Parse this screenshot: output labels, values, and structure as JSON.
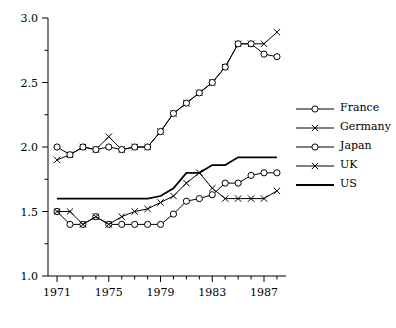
{
  "chart_data": {
    "type": "line",
    "title": "",
    "xlabel": "",
    "ylabel": "",
    "xlim": [
      1970.3,
      1988.7
    ],
    "ylim": [
      1.0,
      3.0
    ],
    "grid": false,
    "legend_position": "right",
    "xticks": [
      1971,
      1975,
      1979,
      1983,
      1987
    ],
    "xtick_labels": [
      "1971",
      "1975",
      "1979",
      "1983",
      "1987"
    ],
    "xminor": [
      1972,
      1973,
      1974,
      1976,
      1977,
      1978,
      1980,
      1981,
      1982,
      1984,
      1985,
      1986,
      1988
    ],
    "yticks": [
      1.0,
      1.5,
      2.0,
      2.5,
      3.0
    ],
    "ytick_labels": [
      "1.0",
      "1.5",
      "2.0",
      "2.5",
      "3.0"
    ],
    "yminor": [
      1.25,
      1.75,
      2.25,
      2.75
    ],
    "x": [
      1971,
      1972,
      1973,
      1974,
      1975,
      1976,
      1977,
      1978,
      1979,
      1980,
      1981,
      1982,
      1983,
      1984,
      1985,
      1986,
      1987,
      1988
    ],
    "series": [
      {
        "name": "France",
        "marker": "circle",
        "values": [
          1.5,
          1.4,
          1.4,
          1.46,
          1.4,
          1.4,
          1.4,
          1.4,
          1.4,
          1.48,
          1.58,
          1.6,
          1.63,
          1.72,
          1.72,
          1.78,
          1.8,
          1.8
        ]
      },
      {
        "name": "Germany",
        "marker": "cross",
        "values": [
          1.9,
          1.94,
          2.0,
          1.98,
          2.08,
          1.98,
          2.0,
          2.0,
          2.12,
          2.26,
          2.34,
          2.42,
          2.5,
          2.62,
          2.8,
          2.8,
          2.8,
          2.89
        ]
      },
      {
        "name": "Japan",
        "marker": "circle",
        "values": [
          2.0,
          1.94,
          2.0,
          1.98,
          2.0,
          1.98,
          2.0,
          2.0,
          2.12,
          2.26,
          2.34,
          2.42,
          2.5,
          2.62,
          2.8,
          2.8,
          2.72,
          2.7
        ]
      },
      {
        "name": "UK",
        "marker": "cross",
        "values": [
          1.5,
          1.5,
          1.4,
          1.46,
          1.4,
          1.46,
          1.5,
          1.52,
          1.57,
          1.62,
          1.72,
          1.8,
          1.68,
          1.6,
          1.6,
          1.6,
          1.6,
          1.66
        ]
      },
      {
        "name": "US",
        "marker": "none",
        "values": [
          1.6,
          1.6,
          1.6,
          1.6,
          1.6,
          1.6,
          1.6,
          1.6,
          1.62,
          1.68,
          1.8,
          1.8,
          1.86,
          1.86,
          1.92,
          1.92,
          1.92,
          1.92
        ]
      }
    ]
  },
  "legend": {
    "items": [
      {
        "label": "France",
        "marker": "circle"
      },
      {
        "label": "Germany",
        "marker": "cross"
      },
      {
        "label": "Japan",
        "marker": "circle"
      },
      {
        "label": "UK",
        "marker": "cross"
      },
      {
        "label": "US",
        "marker": "none"
      }
    ]
  }
}
